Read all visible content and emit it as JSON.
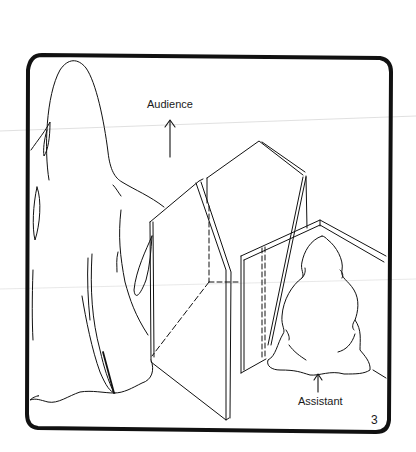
{
  "illustration": {
    "description": "Line drawing of a folding screen stage with a sheet-draped figure in front and a seated figure behind a smaller screen",
    "labels": {
      "audience": "Audience",
      "assistant": "Assistant"
    },
    "page_number": "3",
    "colors": {
      "ink": "#111111",
      "paper": "#ffffff",
      "scan_line": "#d8d8d8"
    }
  }
}
